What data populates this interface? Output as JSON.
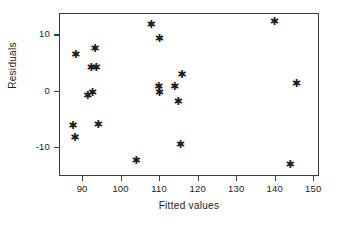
{
  "chart_data": {
    "type": "scatter",
    "title": "",
    "xlabel": "Fitted values",
    "ylabel": "Residuals",
    "xlim": [
      84,
      151.5
    ],
    "ylim": [
      -15.2,
      13.8
    ],
    "xticks": [
      90,
      100,
      110,
      120,
      130,
      140,
      150
    ],
    "xticklabels": [
      "90",
      "100",
      "110",
      "120",
      "130",
      "140",
      "150"
    ],
    "yticks": [
      10,
      0,
      -10
    ],
    "yticklabels": [
      "10",
      "0",
      "-10"
    ],
    "grid": false,
    "legend": null,
    "marker": "asterisk",
    "marker_glyph": "✱",
    "marker_color": "#1c1c1c",
    "frame_color": "#3a3a3a",
    "series": [
      {
        "name": "residuals",
        "points": [
          {
            "x": 88.3,
            "y": 6.5
          },
          {
            "x": 93.3,
            "y": 7.4
          },
          {
            "x": 92.3,
            "y": 4.1
          },
          {
            "x": 93.6,
            "y": 4.1
          },
          {
            "x": 91.4,
            "y": -0.9
          },
          {
            "x": 92.6,
            "y": -0.4
          },
          {
            "x": 87.6,
            "y": -6.3
          },
          {
            "x": 88.1,
            "y": -8.3
          },
          {
            "x": 94.1,
            "y": -6.1
          },
          {
            "x": 104.0,
            "y": -12.5
          },
          {
            "x": 107.9,
            "y": 11.8
          },
          {
            "x": 110.0,
            "y": 9.2
          },
          {
            "x": 109.8,
            "y": 0.8
          },
          {
            "x": 110.0,
            "y": -0.4
          },
          {
            "x": 114.0,
            "y": 0.7
          },
          {
            "x": 115.9,
            "y": 2.8
          },
          {
            "x": 114.9,
            "y": -2.0
          },
          {
            "x": 115.5,
            "y": -9.6
          },
          {
            "x": 139.9,
            "y": 12.3
          },
          {
            "x": 145.6,
            "y": 1.3
          },
          {
            "x": 144.0,
            "y": -13.2
          }
        ]
      }
    ]
  }
}
